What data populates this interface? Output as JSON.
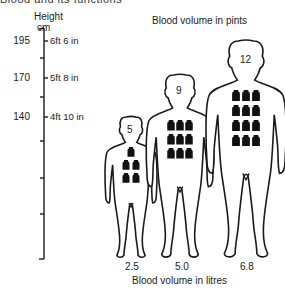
{
  "header": {
    "cut_text": "Blood and its functions",
    "axis_title": "Height",
    "axis_unit": "cm",
    "top_title": "Blood volume in pints",
    "bottom_title": "Blood volume in litres"
  },
  "height_axis": {
    "ticks": [
      {
        "cm": "195",
        "imperial": "6ft 6 in"
      },
      {
        "cm": "170",
        "imperial": "5ft 8 in"
      },
      {
        "cm": "140",
        "imperial": "4ft 10 in"
      }
    ]
  },
  "figures": [
    {
      "size": "small",
      "pints": "5",
      "litres": "2.5"
    },
    {
      "size": "medium",
      "pints": "9",
      "litres": "5.0"
    },
    {
      "size": "large",
      "pints": "12",
      "litres": "6.8"
    }
  ],
  "colors": {
    "ink": "#1a1a1a",
    "background": "#ffffff"
  }
}
